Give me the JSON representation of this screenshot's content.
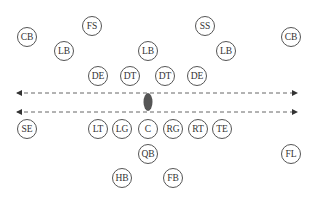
{
  "diagram": {
    "ball": {
      "x": 148,
      "y": 102,
      "color": "#555555"
    },
    "lines": [
      {
        "name": "line-of-scrimmage-defense",
        "y": 93,
        "x1": 17,
        "x2": 297
      },
      {
        "name": "line-of-scrimmage-offense",
        "y": 112,
        "x1": 17,
        "x2": 297
      }
    ],
    "players": [
      {
        "label": "CB",
        "x": 27,
        "y": 37
      },
      {
        "label": "FS",
        "x": 92,
        "y": 26
      },
      {
        "label": "SS",
        "x": 205,
        "y": 26
      },
      {
        "label": "CB",
        "x": 291,
        "y": 37
      },
      {
        "label": "LB",
        "x": 64,
        "y": 51
      },
      {
        "label": "LB",
        "x": 148,
        "y": 51
      },
      {
        "label": "LB",
        "x": 226,
        "y": 51
      },
      {
        "label": "DE",
        "x": 98,
        "y": 76
      },
      {
        "label": "DT",
        "x": 130,
        "y": 76
      },
      {
        "label": "DT",
        "x": 165,
        "y": 76
      },
      {
        "label": "DE",
        "x": 197,
        "y": 76
      },
      {
        "label": "SE",
        "x": 27,
        "y": 129
      },
      {
        "label": "LT",
        "x": 98,
        "y": 129
      },
      {
        "label": "LG",
        "x": 122,
        "y": 129
      },
      {
        "label": "C",
        "x": 148,
        "y": 129
      },
      {
        "label": "RG",
        "x": 173,
        "y": 129
      },
      {
        "label": "RT",
        "x": 198,
        "y": 129
      },
      {
        "label": "TE",
        "x": 222,
        "y": 129
      },
      {
        "label": "QB",
        "x": 148,
        "y": 154
      },
      {
        "label": "FL",
        "x": 291,
        "y": 154
      },
      {
        "label": "HB",
        "x": 122,
        "y": 178
      },
      {
        "label": "FB",
        "x": 173,
        "y": 178
      }
    ]
  }
}
